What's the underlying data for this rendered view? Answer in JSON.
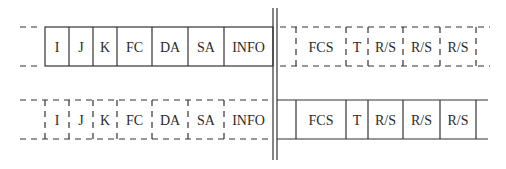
{
  "diagram": {
    "top_row": {
      "style_left": "solid",
      "style_right": "dashed",
      "left_fields": [
        "I",
        "J",
        "K",
        "FC",
        "DA",
        "SA",
        "INFO"
      ],
      "right_fields": [
        "FCS",
        "T",
        "R/S",
        "R/S",
        "R/S"
      ]
    },
    "bottom_row": {
      "style_left": "dashed",
      "style_right": "solid",
      "left_fields": [
        "I",
        "J",
        "K",
        "FC",
        "DA",
        "SA",
        "INFO"
      ],
      "right_fields": [
        "FCS",
        "T",
        "R/S",
        "R/S",
        "R/S"
      ]
    },
    "separator": "double-vertical-line",
    "line_color": "#333333"
  }
}
